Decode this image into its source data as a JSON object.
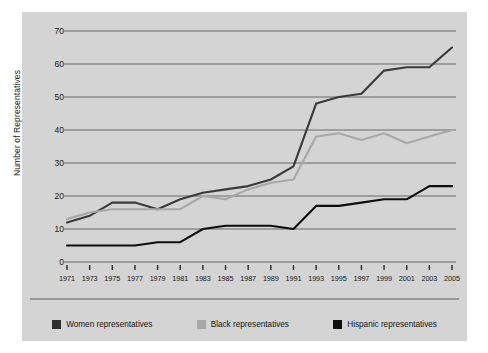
{
  "chart_data": {
    "type": "line",
    "title": "",
    "xlabel": "",
    "ylabel": "Number of Representatives",
    "ylim": [
      0,
      70
    ],
    "ytick_values": [
      0,
      10,
      20,
      30,
      40,
      50,
      60,
      70
    ],
    "grid": true,
    "legend_position": "bottom",
    "categories": [
      1971,
      1973,
      1975,
      1977,
      1979,
      1981,
      1983,
      1985,
      1987,
      1989,
      1991,
      1993,
      1995,
      1997,
      1999,
      2001,
      2003,
      2005
    ],
    "x_tick_labels": [
      "1971",
      "1973",
      "1975",
      "1977",
      "1979",
      "1981",
      "1983",
      "1985",
      "1987",
      "1989",
      "1991",
      "1993",
      "1995",
      "1997",
      "1999",
      "2001",
      "2003",
      "2005"
    ],
    "series": [
      {
        "name": "Women representatives",
        "color": "#3a3a3a",
        "values": [
          12,
          14,
          18,
          18,
          16,
          19,
          21,
          22,
          23,
          25,
          29,
          48,
          50,
          51,
          58,
          59,
          59,
          65
        ]
      },
      {
        "name": "Black representatives",
        "color": "#a8a8a8",
        "values": [
          13,
          15,
          16,
          16,
          16,
          16,
          20,
          19,
          22,
          24,
          25,
          38,
          39,
          37,
          39,
          36,
          38,
          40
        ]
      },
      {
        "name": "Hispanic representatives",
        "color": "#0d0d0d",
        "values": [
          5,
          5,
          5,
          5,
          6,
          6,
          10,
          11,
          11,
          11,
          10,
          17,
          17,
          18,
          19,
          19,
          23,
          23
        ]
      }
    ]
  },
  "legend": {
    "items": [
      {
        "label": "Women representatives",
        "color": "#2e2e2e"
      },
      {
        "label": "Black representatives",
        "color": "#a8a8a8"
      },
      {
        "label": "Hispanic representatives",
        "color": "#0d0d0d"
      }
    ]
  },
  "colors": {
    "panel_background": "#d4d4d4",
    "page_background": "#ffffff",
    "gridline": "#5b5b5b",
    "text": "#1a1a1a"
  }
}
